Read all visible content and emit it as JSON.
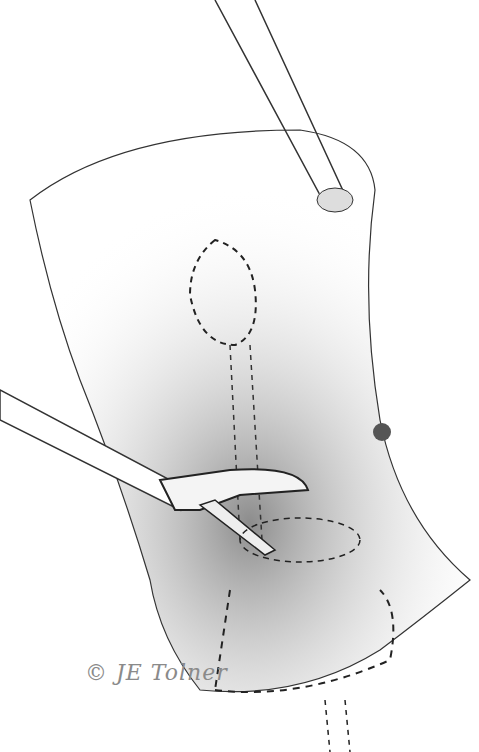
{
  "illustration": {
    "subject": "surgical pencil illustration: stomach with clamp and retractor instruments",
    "signature": "© JE Tolner",
    "colors": {
      "line": "#222222",
      "shade": "#9a9a9a",
      "paper": "#ffffff"
    }
  }
}
